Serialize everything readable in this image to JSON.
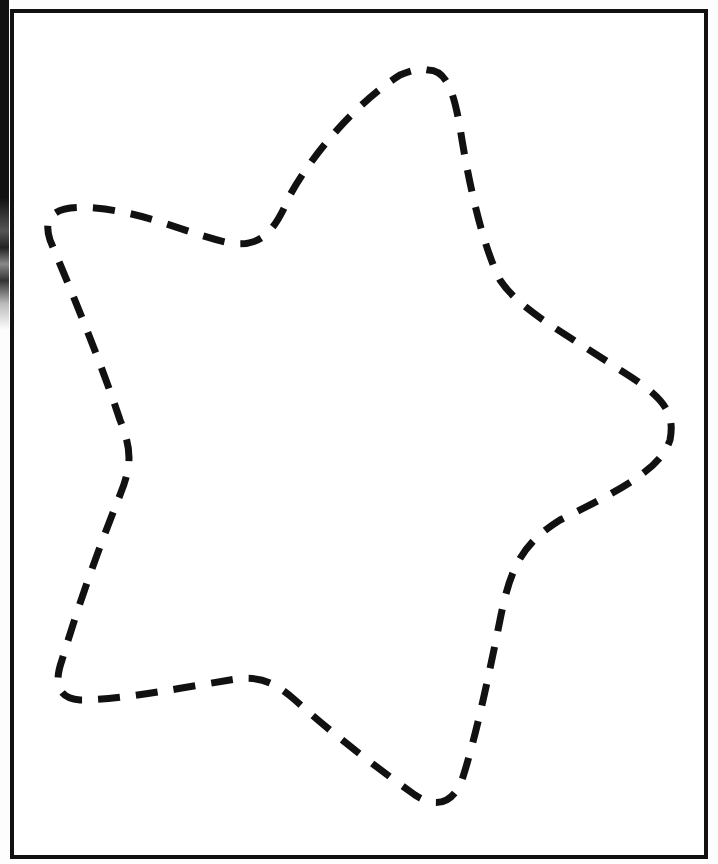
{
  "worksheet": {
    "type": "tracing-worksheet",
    "shape": "star",
    "shape_style": "dashed-outline",
    "points": 5,
    "colors": {
      "background": "#ffffff",
      "outline": "#111111",
      "frame": "#111111"
    },
    "star_path": "M 428 70 C 448 70 455 95 462 140 C 472 200 485 250 500 280 C 520 310 560 330 620 370 C 660 395 676 410 670 440 C 660 470 620 490 560 520 C 520 545 510 570 500 620 C 488 680 475 740 462 780 C 452 805 435 808 415 795 C 380 770 340 740 295 700 C 270 678 255 676 230 680 C 180 688 120 700 80 700 C 55 698 55 680 62 660 C 80 600 100 545 120 495 C 132 465 132 450 120 420 C 100 360 75 300 50 240 C 42 215 55 205 95 208 C 150 213 190 235 230 243 C 262 248 275 230 290 195 C 315 150 360 100 400 75 C 412 70 420 68 428 70 Z"
  }
}
